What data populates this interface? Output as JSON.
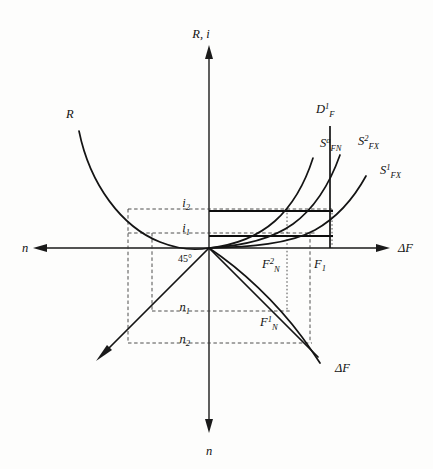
{
  "figure": {
    "background_color": "#fdfdfc",
    "ink_color": "#111111"
  },
  "axes": {
    "vertical_top_label": "R, i",
    "vertical_bottom_label": "n",
    "horizontal_right_label": "ΔF",
    "horizontal_left_label": "n",
    "origin_x": 209,
    "origin_y": 248,
    "angle_label": "45°"
  },
  "curves": [
    {
      "id": "R",
      "label_main": "R",
      "label_sup": "",
      "label_sub": "",
      "label_x": 66,
      "label_y": 118
    },
    {
      "id": "D1F",
      "label_main": "D",
      "label_sup": "1",
      "label_sub": "F",
      "label_x": 316,
      "label_y": 113
    },
    {
      "id": "SaFN",
      "label_main": "S",
      "label_sup": "a",
      "label_sub": "FN",
      "label_x": 320,
      "label_y": 147
    },
    {
      "id": "S2FX",
      "label_main": "S",
      "label_sup": "2",
      "label_sub": "FX",
      "label_x": 358,
      "label_y": 145
    },
    {
      "id": "S1FX",
      "label_main": "S",
      "label_sup": "1",
      "label_sub": "FX",
      "label_x": 380,
      "label_y": 174
    },
    {
      "id": "dF",
      "label_main": "ΔF",
      "label_sup": "",
      "label_sub": "",
      "label_x": 335,
      "label_y": 372
    }
  ],
  "value_labels": [
    {
      "id": "i2",
      "main": "i",
      "sub": "2",
      "sup": "",
      "x": 190,
      "y": 204,
      "axis": "vertical-positive"
    },
    {
      "id": "i1",
      "main": "i",
      "sub": "1",
      "sup": "",
      "x": 190,
      "y": 229,
      "axis": "vertical-positive"
    },
    {
      "id": "n1",
      "main": "n",
      "sub": "1",
      "sup": "",
      "x": 186,
      "y": 309,
      "axis": "vertical-negative"
    },
    {
      "id": "n2",
      "main": "n",
      "sub": "2",
      "sup": "",
      "x": 186,
      "y": 341,
      "axis": "vertical-negative"
    },
    {
      "id": "F2N",
      "main": "F",
      "sub": "N",
      "sup": "2",
      "x": 266,
      "y": 266,
      "axis": "horizontal-positive"
    },
    {
      "id": "F1",
      "main": "F",
      "sub": "1",
      "sup": "",
      "x": 312,
      "y": 266,
      "axis": "horizontal-positive"
    },
    {
      "id": "F1N",
      "main": "F",
      "sub": "N",
      "sup": "1",
      "x": 270,
      "y": 322,
      "axis": "fourth-quadrant"
    }
  ],
  "levels": {
    "i2_y": 209,
    "i1_y": 233,
    "n1_y": 311,
    "n2_y": 343,
    "F2N_x": 287,
    "F1_x": 330,
    "left_guide_x1": 128,
    "left_guide_x2": 152,
    "right_dashed_x": 310
  }
}
